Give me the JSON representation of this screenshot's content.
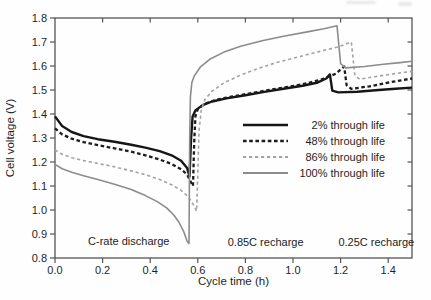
{
  "chart_data": {
    "type": "line",
    "xlabel": "Cycle time (h)",
    "ylabel": "Cell voltage (V)",
    "xlim": [
      0,
      1.5
    ],
    "ylim": [
      0.8,
      1.8
    ],
    "grid": false,
    "legend_position": "inside-center-right",
    "x_ticks": [
      0.0,
      0.2,
      0.4,
      0.6,
      0.8,
      1.0,
      1.2,
      1.4
    ],
    "x_tick_labels": [
      "0.0",
      "0.2",
      "0.4",
      "0.6",
      "0.8",
      "1.0",
      "1.2",
      "1.4"
    ],
    "y_ticks": [
      0.8,
      0.9,
      1.0,
      1.1,
      1.2,
      1.3,
      1.4,
      1.5,
      1.6,
      1.7,
      1.8
    ],
    "y_tick_labels": [
      "0.8",
      "0.9",
      "1.0",
      "1.1",
      "1.2",
      "1.3",
      "1.4",
      "1.5",
      "1.6",
      "1.7",
      "1.8"
    ],
    "axis_color": "#555555",
    "text_color": "#1f1f1f",
    "annotations": [
      {
        "text": "C-rate discharge",
        "x": 0.31,
        "y": 0.871
      },
      {
        "text": "0.85C recharge",
        "x": 0.885,
        "y": 0.866
      },
      {
        "text": "0.25C recharge",
        "x": 1.35,
        "y": 0.866
      }
    ],
    "series": [
      {
        "name": "2% through life",
        "color": "#161616",
        "style": "solid",
        "width": 2.4,
        "dash": null,
        "points": [
          [
            0,
            1.39
          ],
          [
            0.03,
            1.35
          ],
          [
            0.07,
            1.325
          ],
          [
            0.12,
            1.308
          ],
          [
            0.18,
            1.295
          ],
          [
            0.25,
            1.284
          ],
          [
            0.32,
            1.272
          ],
          [
            0.38,
            1.26
          ],
          [
            0.44,
            1.245
          ],
          [
            0.49,
            1.228
          ],
          [
            0.53,
            1.205
          ],
          [
            0.555,
            1.175
          ],
          [
            0.565,
            1.14
          ],
          [
            0.572,
            1.3
          ],
          [
            0.578,
            1.39
          ],
          [
            0.59,
            1.415
          ],
          [
            0.62,
            1.437
          ],
          [
            0.66,
            1.452
          ],
          [
            0.72,
            1.465
          ],
          [
            0.8,
            1.478
          ],
          [
            0.88,
            1.492
          ],
          [
            0.96,
            1.505
          ],
          [
            1.04,
            1.518
          ],
          [
            1.1,
            1.53
          ],
          [
            1.14,
            1.548
          ],
          [
            1.155,
            1.565
          ],
          [
            1.165,
            1.497
          ],
          [
            1.19,
            1.49
          ],
          [
            1.27,
            1.493
          ],
          [
            1.36,
            1.5
          ],
          [
            1.43,
            1.505
          ],
          [
            1.5,
            1.51
          ]
        ]
      },
      {
        "name": "48% through life",
        "color": "#1c1c1c",
        "style": "dashed",
        "width": 2.3,
        "dash": "3.6 2.6",
        "points": [
          [
            0,
            1.34
          ],
          [
            0.03,
            1.315
          ],
          [
            0.07,
            1.297
          ],
          [
            0.12,
            1.283
          ],
          [
            0.18,
            1.27
          ],
          [
            0.25,
            1.257
          ],
          [
            0.32,
            1.243
          ],
          [
            0.38,
            1.228
          ],
          [
            0.44,
            1.21
          ],
          [
            0.49,
            1.192
          ],
          [
            0.53,
            1.17
          ],
          [
            0.555,
            1.148
          ],
          [
            0.572,
            1.115
          ],
          [
            0.58,
            1.1
          ],
          [
            0.585,
            1.28
          ],
          [
            0.59,
            1.39
          ],
          [
            0.6,
            1.42
          ],
          [
            0.63,
            1.443
          ],
          [
            0.68,
            1.46
          ],
          [
            0.74,
            1.472
          ],
          [
            0.82,
            1.486
          ],
          [
            0.9,
            1.5
          ],
          [
            0.98,
            1.513
          ],
          [
            1.06,
            1.528
          ],
          [
            1.13,
            1.547
          ],
          [
            1.18,
            1.568
          ],
          [
            1.215,
            1.598
          ],
          [
            1.225,
            1.52
          ],
          [
            1.245,
            1.505
          ],
          [
            1.32,
            1.515
          ],
          [
            1.41,
            1.533
          ],
          [
            1.5,
            1.548
          ]
        ]
      },
      {
        "name": "86% through life",
        "color": "#a3a3a3",
        "style": "dashed",
        "width": 1.6,
        "dash": "3.2 2.8",
        "points": [
          [
            0,
            1.25
          ],
          [
            0.03,
            1.232
          ],
          [
            0.07,
            1.218
          ],
          [
            0.12,
            1.206
          ],
          [
            0.18,
            1.194
          ],
          [
            0.25,
            1.18
          ],
          [
            0.32,
            1.163
          ],
          [
            0.38,
            1.147
          ],
          [
            0.44,
            1.127
          ],
          [
            0.49,
            1.105
          ],
          [
            0.53,
            1.082
          ],
          [
            0.56,
            1.055
          ],
          [
            0.58,
            1.025
          ],
          [
            0.595,
            0.995
          ],
          [
            0.6,
            1.15
          ],
          [
            0.605,
            1.33
          ],
          [
            0.615,
            1.42
          ],
          [
            0.63,
            1.46
          ],
          [
            0.66,
            1.495
          ],
          [
            0.71,
            1.53
          ],
          [
            0.78,
            1.562
          ],
          [
            0.86,
            1.592
          ],
          [
            0.94,
            1.617
          ],
          [
            1.03,
            1.64
          ],
          [
            1.11,
            1.66
          ],
          [
            1.19,
            1.68
          ],
          [
            1.245,
            1.7
          ],
          [
            1.26,
            1.56
          ],
          [
            1.28,
            1.545
          ],
          [
            1.36,
            1.558
          ],
          [
            1.44,
            1.57
          ],
          [
            1.5,
            1.578
          ]
        ]
      },
      {
        "name": "100% through life",
        "color": "#8c8c8c",
        "style": "solid",
        "width": 1.6,
        "dash": null,
        "points": [
          [
            0,
            1.19
          ],
          [
            0.03,
            1.172
          ],
          [
            0.07,
            1.157
          ],
          [
            0.12,
            1.143
          ],
          [
            0.18,
            1.127
          ],
          [
            0.25,
            1.107
          ],
          [
            0.32,
            1.085
          ],
          [
            0.38,
            1.06
          ],
          [
            0.43,
            1.035
          ],
          [
            0.47,
            1.008
          ],
          [
            0.5,
            0.978
          ],
          [
            0.52,
            0.95
          ],
          [
            0.54,
            0.912
          ],
          [
            0.555,
            0.87
          ],
          [
            0.563,
            0.86
          ],
          [
            0.566,
            1.3
          ],
          [
            0.569,
            1.47
          ],
          [
            0.575,
            1.53
          ],
          [
            0.585,
            1.558
          ],
          [
            0.61,
            1.595
          ],
          [
            0.65,
            1.628
          ],
          [
            0.71,
            1.658
          ],
          [
            0.78,
            1.682
          ],
          [
            0.87,
            1.705
          ],
          [
            0.96,
            1.724
          ],
          [
            1.06,
            1.742
          ],
          [
            1.13,
            1.755
          ],
          [
            1.185,
            1.768
          ],
          [
            1.2,
            1.61
          ],
          [
            1.22,
            1.592
          ],
          [
            1.3,
            1.598
          ],
          [
            1.38,
            1.607
          ],
          [
            1.45,
            1.614
          ],
          [
            1.5,
            1.62
          ]
        ]
      }
    ]
  }
}
